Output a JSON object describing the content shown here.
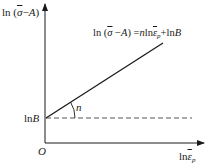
{
  "diagram": {
    "y_axis_label": {
      "prefix": "ln (",
      "sigma": "σ",
      "suffix": "−",
      "A": "A",
      "close": ")"
    },
    "x_axis_label": {
      "prefix": "ln",
      "epsilon": "ε",
      "sub": "p"
    },
    "equation": {
      "lhs_prefix": "ln (",
      "sigma": "σ",
      "minus": " −",
      "A": "A",
      "close": ")",
      "eq": " =",
      "n": "n",
      "ln1": "ln",
      "epsilon": "ε",
      "sub": "p",
      "plus": "+ln",
      "B": "B"
    },
    "intercept_label": {
      "ln": "ln",
      "B": "B"
    },
    "origin_label": "O",
    "slope_label": "n",
    "colors": {
      "line": "#1a1a1a",
      "dashed": "#555555",
      "axes": "#1a1a1a"
    }
  }
}
